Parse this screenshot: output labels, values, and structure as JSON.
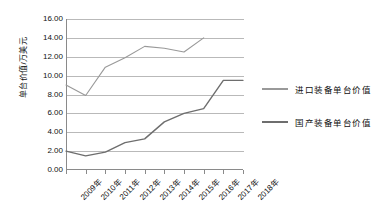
{
  "chart_data": {
    "type": "line",
    "title": "",
    "xlabel": "",
    "ylabel": "单台价值/万美元",
    "categories": [
      "2009年",
      "2010年",
      "2011年",
      "2012年",
      "2013年",
      "2014年",
      "2015年",
      "2016年",
      "2017年",
      "2018年"
    ],
    "ylim": [
      0,
      16
    ],
    "ytick_step": 2,
    "ytick_labels": [
      "0.00",
      "2.00",
      "4.00",
      "6.00",
      "8.00",
      "10.00",
      "12.00",
      "14.00",
      "16.00"
    ],
    "grid": true,
    "legend_position": "right",
    "series": [
      {
        "name": "进口装备单台价值",
        "color": "#999999",
        "values": [
          9.0,
          7.9,
          10.9,
          11.9,
          13.1,
          12.9,
          12.5,
          14.0,
          null,
          null
        ]
      },
      {
        "name": "国产装备单台价值",
        "color": "#6e6e6e",
        "values": [
          2.0,
          1.5,
          1.9,
          2.9,
          3.3,
          5.1,
          6.0,
          6.5,
          9.5,
          9.5
        ]
      }
    ]
  },
  "legend": {
    "entries": [
      {
        "label": "进口装备单台价值"
      },
      {
        "label": "国产装备单台价值"
      }
    ]
  },
  "colors": {
    "import_series": "#999999",
    "domestic_series": "#6e6e6e",
    "gridline": "#b9b9b9",
    "axis": "#8a8a8a",
    "text": "#111111",
    "background": "#ffffff"
  }
}
